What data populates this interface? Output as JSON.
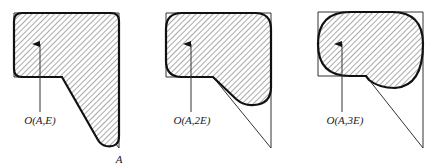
{
  "figure": {
    "panels": [
      {
        "id": "panel-E",
        "label": "O(A,E)",
        "polygon": [
          [
            14,
            13
          ],
          [
            119,
            13
          ],
          [
            119,
            148
          ],
          [
            62,
            77
          ],
          [
            14,
            77
          ]
        ],
        "shape": "M14,21 Q14,13 22,13 L111,13 Q119,13 119,21 L119,136 Q119,148 106,146 Q101,145 98,140 L62,77 L22,77 Q14,77 14,69 Z",
        "arrow": {
          "x": 40,
          "y1": 112,
          "y2": 44
        },
        "label_pos": [
          40,
          124
        ]
      },
      {
        "id": "panel-2E",
        "label": "O(A,2E)",
        "polygon": [
          [
            166,
            13
          ],
          [
            271,
            13
          ],
          [
            271,
            148
          ],
          [
            213,
            77
          ],
          [
            166,
            77
          ]
        ],
        "shape": "M166,29 Q166,13 182,13 L255,13 Q271,13 271,29 L271,87 Q271,104 254,105 Q244,106 236,99 L213,77 L182,77 Q166,77 166,61 Z",
        "arrow": {
          "x": 191,
          "y1": 112,
          "y2": 44
        },
        "label_pos": [
          192,
          124
        ]
      },
      {
        "id": "panel-3E",
        "label": "O(A,3E)",
        "polygon": [
          [
            318,
            12
          ],
          [
            423,
            12
          ],
          [
            423,
            148
          ],
          [
            366,
            76
          ],
          [
            318,
            76
          ]
        ],
        "shape": "M318,44 Q318,12 350,12 L392,12 Q423,12 423,44 Q423,86 395,88 Q379,88 369,80 L366,76 L350,76 Q318,76 318,44 Z",
        "arrow": {
          "x": 342,
          "y1": 112,
          "y2": 44
        },
        "label_pos": [
          345,
          124
        ]
      }
    ],
    "vertex_label": {
      "text": "A",
      "pos": [
        119,
        163
      ]
    }
  }
}
